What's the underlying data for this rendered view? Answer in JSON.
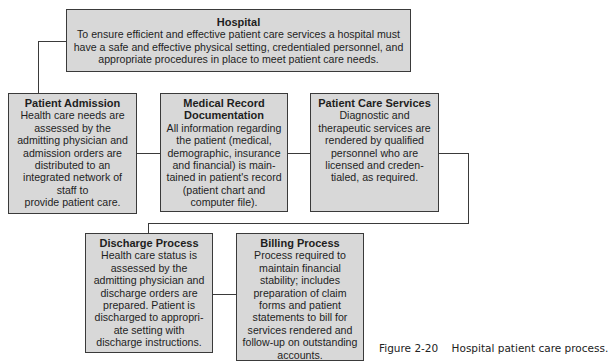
{
  "diagram": {
    "nodes": [
      {
        "id": "hospital",
        "title": "Hospital",
        "body": "To ensure efficient and effective patient care services a hospital must\nhave a safe and effective physical setting, credentialed personnel, and\nappropriate procedures in place to meet patient care needs."
      },
      {
        "id": "patient_admission",
        "title": "Patient Admission",
        "body": "Health care needs are\nassessed by the\nadmitting physician and\nadmission orders are\ndistributed to an\nintegrated network of\nstaff to\nprovide patient care."
      },
      {
        "id": "medical_record",
        "title": "Medical Record\nDocumentation",
        "body": "All information regarding\nthe patient (medical,\ndemographic, insurance\nand financial) is main-\ntained in patient's record\n(patient chart and\ncomputer file)."
      },
      {
        "id": "patient_care",
        "title": "Patient Care Services",
        "body": "Diagnostic and\ntherapeutic services are\nrendered by qualified\npersonnel who are\nlicensed and creden-\ntialed, as required."
      },
      {
        "id": "discharge",
        "title": "Discharge Process",
        "body": "Health care status is\nassessed by the\nadmitting physician and\ndischarge orders are\nprepared. Patient is\ndischarged to appropri-\nate setting with\ndischarge instructions."
      },
      {
        "id": "billing",
        "title": "Billing Process",
        "body": "Process required to\nmaintain financial\nstability; includes\npreparation of claim\nforms and patient\nstatements to bill for\nservices rendered and\nfollow-up on outstanding\naccounts."
      }
    ],
    "edges": [
      [
        "hospital",
        "patient_admission"
      ],
      [
        "patient_admission",
        "medical_record"
      ],
      [
        "medical_record",
        "patient_care"
      ],
      [
        "patient_care",
        "discharge"
      ],
      [
        "discharge",
        "billing"
      ]
    ],
    "colors": {
      "box_fill": "#d8d8d8",
      "border": "#3a3a3a",
      "text": "#1e1e1e"
    }
  },
  "caption": "Figure 2-20    Hospital patient care process."
}
